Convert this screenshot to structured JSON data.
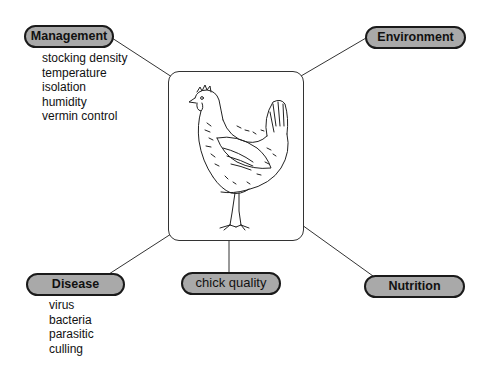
{
  "diagram": {
    "center": {
      "image": "hen-illustration",
      "description": "line drawing of a hen"
    },
    "nodes": {
      "management": {
        "label": "Management",
        "items": [
          "stocking density",
          "temperature",
          "isolation",
          "humidity",
          "vermin control"
        ]
      },
      "environment": {
        "label": "Environment"
      },
      "disease": {
        "label": "Disease",
        "items": [
          "virus",
          "bacteria",
          "parasitic",
          "culling"
        ]
      },
      "chick_quality": {
        "label": "chick quality"
      },
      "nutrition": {
        "label": "Nutrition"
      }
    },
    "colors": {
      "pill_fill": "#a9a9a9",
      "pill_border": "#1a1a1a",
      "line": "#333333",
      "background": "#ffffff"
    }
  }
}
